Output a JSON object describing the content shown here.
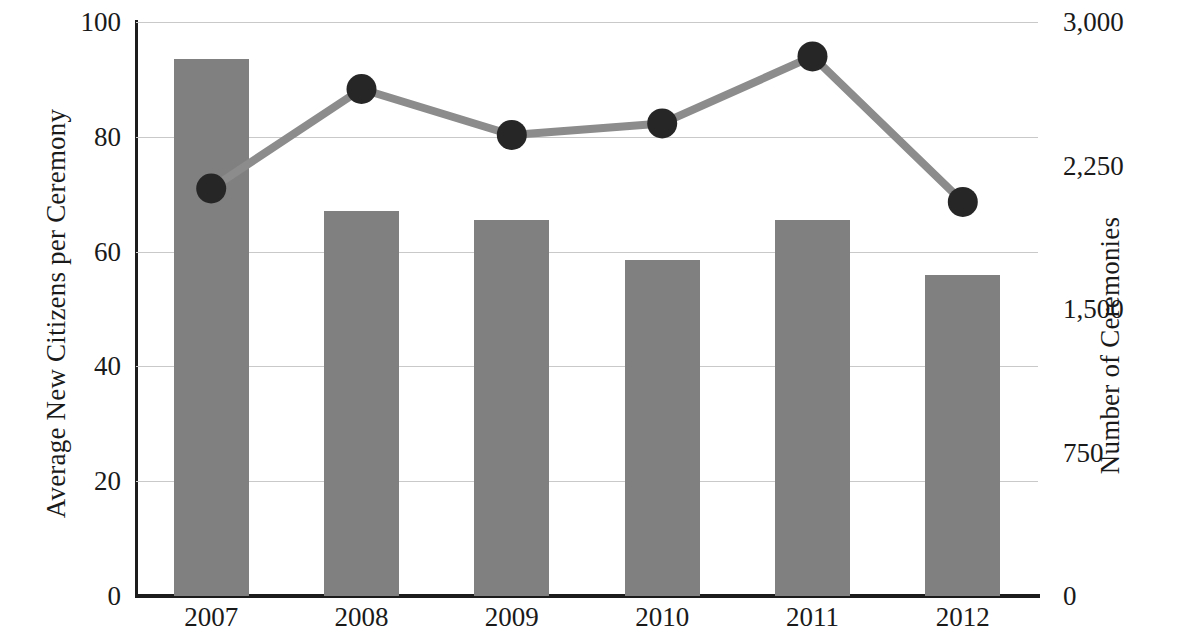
{
  "chart_data": {
    "type": "bar",
    "title": "",
    "xlabel": "",
    "categories": [
      "2007",
      "2008",
      "2009",
      "2010",
      "2011",
      "2012"
    ],
    "grid": true,
    "legend": "none",
    "series": [
      {
        "name": "Average New Citizens per Ceremony",
        "type": "bar",
        "axis": "left",
        "color": "#808080",
        "values": [
          93.5,
          67,
          65.5,
          58.5,
          65.5,
          56
        ]
      },
      {
        "name": "Number of Ceremonies",
        "type": "line",
        "axis": "right",
        "color": "#8c8c8c",
        "marker_color": "#262626",
        "values": [
          2130,
          2650,
          2410,
          2470,
          2820,
          2060
        ]
      }
    ],
    "left_axis": {
      "label": "Average New Citizens per Ceremony",
      "ticks": [
        "0",
        "20",
        "40",
        "60",
        "80",
        "100"
      ],
      "tick_values": [
        0,
        20,
        40,
        60,
        80,
        100
      ],
      "min": 0,
      "max": 100
    },
    "right_axis": {
      "label": "Number of Ceremonies",
      "ticks": [
        "0",
        "750",
        "1,500",
        "2,250",
        "3,000"
      ],
      "tick_values": [
        0,
        750,
        1500,
        2250,
        3000
      ],
      "min": 0,
      "max": 3000
    }
  },
  "left_ticks": [
    {
      "label": "100",
      "value": 100
    },
    {
      "label": "80",
      "value": 80
    },
    {
      "label": "60",
      "value": 60
    },
    {
      "label": "40",
      "value": 40
    },
    {
      "label": "20",
      "value": 20
    },
    {
      "label": "0",
      "value": 0
    }
  ],
  "right_ticks": [
    {
      "label": "3,000",
      "value": 3000
    },
    {
      "label": "2,250",
      "value": 2250
    },
    {
      "label": "1,500",
      "value": 1500
    },
    {
      "label": "750",
      "value": 750
    },
    {
      "label": "0",
      "value": 0
    }
  ],
  "x_ticks": [
    "2007",
    "2008",
    "2009",
    "2010",
    "2011",
    "2012"
  ],
  "labels": {
    "y_left": "Average New Citizens per Ceremony",
    "y_right": "Number of Ceremonies"
  },
  "colors": {
    "bar": "#808080",
    "line": "#8c8c8c",
    "marker": "#262626",
    "axis": "#1c1c1c",
    "grid": "#c9c9c9",
    "text": "#1a1a1a"
  }
}
